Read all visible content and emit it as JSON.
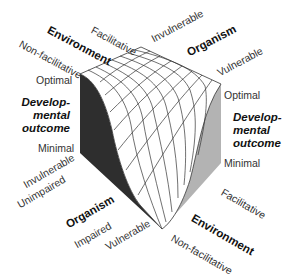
{
  "diagram": {
    "type": "3d-surface-cube",
    "colors": {
      "left_face": "#2e2e2e",
      "right_face": "#b3b3b3",
      "surface": "#ffffff",
      "grid_lines": "#333333"
    },
    "top_left_axis": {
      "title": "Environment",
      "low": "Non-facilitative",
      "high": "Facilitative"
    },
    "top_right_axis": {
      "title": "Organism",
      "low": "Invulnerable",
      "high": "Vulnerable"
    },
    "left_vertical_axis": {
      "title_line1": "Develop-",
      "title_line2": "mental",
      "title_line3": "outcome",
      "top": "Optimal",
      "bottom": "Minimal"
    },
    "right_vertical_axis": {
      "title_line1": "Develop-",
      "title_line2": "mental",
      "title_line3": "outcome",
      "top": "Optimal",
      "bottom": "Minimal"
    },
    "bottom_left_axis": {
      "title": "Organism",
      "labels": [
        "Invulnerable",
        "Unimpaired",
        "Impaired",
        "Vulnerable"
      ]
    },
    "bottom_right_axis": {
      "title": "Environment",
      "high": "Facilitative",
      "low": "Non-facilitative"
    }
  }
}
